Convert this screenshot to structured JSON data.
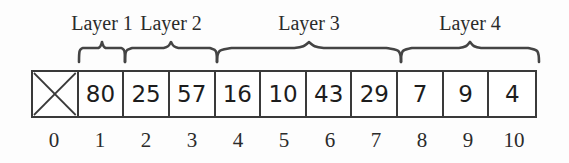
{
  "figure": {
    "type": "array-diagram"
  },
  "array": {
    "cells": [
      {
        "index": "0",
        "value": "",
        "crossed": true
      },
      {
        "index": "1",
        "value": "80",
        "crossed": false
      },
      {
        "index": "2",
        "value": "25",
        "crossed": false
      },
      {
        "index": "3",
        "value": "57",
        "crossed": false
      },
      {
        "index": "4",
        "value": "16",
        "crossed": false
      },
      {
        "index": "5",
        "value": "10",
        "crossed": false
      },
      {
        "index": "6",
        "value": "43",
        "crossed": false
      },
      {
        "index": "7",
        "value": "29",
        "crossed": false
      },
      {
        "index": "8",
        "value": "7",
        "crossed": false
      },
      {
        "index": "9",
        "value": "9",
        "crossed": false
      },
      {
        "index": "10",
        "value": "4",
        "crossed": false
      }
    ]
  },
  "indices": [
    "0",
    "1",
    "2",
    "3",
    "4",
    "5",
    "6",
    "7",
    "8",
    "9",
    "10"
  ],
  "layers": [
    {
      "label": "Layer 1",
      "start_index": 1,
      "end_index": 1,
      "left": 79,
      "width": 46,
      "label_center": 102
    },
    {
      "label": "Layer 2",
      "start_index": 2,
      "end_index": 3,
      "left": 125,
      "width": 92,
      "label_center": 171
    },
    {
      "label": "Layer 3",
      "start_index": 4,
      "end_index": 7,
      "left": 217,
      "width": 184,
      "label_center": 309
    },
    {
      "label": "Layer 4",
      "start_index": 8,
      "end_index": 10,
      "left": 401,
      "width": 138,
      "label_center": 470
    }
  ],
  "colors": {
    "background": "#fdfdfd",
    "cell_background": "#ffffff",
    "border": "#3a3a3a",
    "brace": "#444444",
    "text": "#1d1d1d",
    "label_text": "#2b2b2b"
  }
}
